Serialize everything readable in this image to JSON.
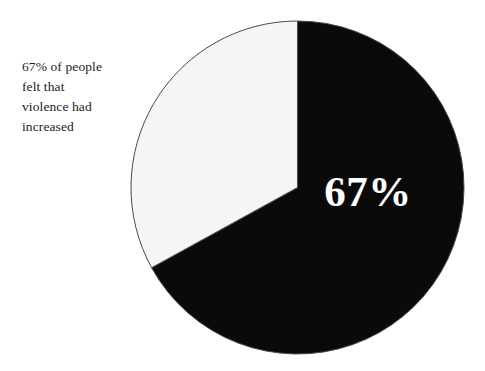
{
  "figure": {
    "background_color": "#ffffff",
    "caption_lines": [
      "67% of people",
      "felt that",
      "violence had",
      "increased"
    ],
    "caption_text": "67% of people felt that violence had increased",
    "value_label": "67%"
  },
  "chart_data": {
    "type": "pie",
    "title": "",
    "subtitle": "",
    "xlabel": "",
    "ylabel": "",
    "grid": false,
    "legend_position": "none",
    "start_angle_deg": 0,
    "direction": "clockwise",
    "categories": [
      "Felt violence had increased",
      "Did not feel violence had increased"
    ],
    "values": [
      67,
      33
    ],
    "units": "percent",
    "data_labels": [
      "67%",
      ""
    ],
    "slice_colors": [
      "#0a0a0a",
      "#f5f5f5"
    ],
    "slice_edge_color": "#4a4a4a",
    "slice_label_colors": [
      "#ffffff",
      "#1c1c1c"
    ],
    "annotations": [
      {
        "text": "67% of people felt that violence had increased",
        "position": "left-of-chart"
      }
    ]
  }
}
